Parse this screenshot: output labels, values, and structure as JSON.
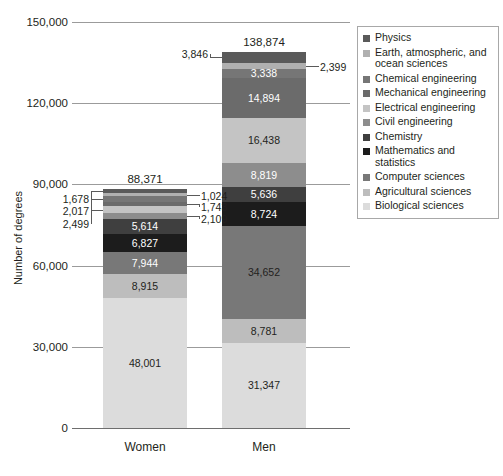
{
  "chart_data": {
    "type": "bar",
    "subtype": "stacked",
    "title": "",
    "xlabel": "",
    "ylabel": "Number of degrees",
    "categories": [
      "Women",
      "Men"
    ],
    "ylim": [
      0,
      150000
    ],
    "yticks": [
      0,
      30000,
      60000,
      90000,
      120000,
      150000
    ],
    "ytick_labels": [
      "0",
      "30,000",
      "60,000",
      "90,000",
      "120,000",
      "150,000"
    ],
    "grid": true,
    "legend_position": "right",
    "totals": {
      "Women": 88371,
      "Men": 138874
    },
    "total_labels": {
      "Women": "88,371",
      "Men": "138,874"
    },
    "series": [
      {
        "name": "Physics",
        "color": "#5a5a5a",
        "values": [
          1678,
          3846
        ],
        "labels": [
          "1,678",
          "3,846"
        ],
        "label_mode": [
          "callout-left",
          "callout-left"
        ]
      },
      {
        "name": "Earth, atmospheric, and ocean sciences",
        "color": "#b0b0b0",
        "values": [
          1024,
          2399
        ],
        "labels": [
          "1,024",
          "2,399"
        ],
        "label_mode": [
          "callout-right",
          "callout-right"
        ]
      },
      {
        "name": "Chemical engineering",
        "color": "#767676",
        "values": [
          2017,
          3338
        ],
        "labels": [
          "2,017",
          "3,338"
        ],
        "label_mode": [
          "callout-left",
          "inside-light"
        ]
      },
      {
        "name": "Mechanical engineering",
        "color": "#6b6b6b",
        "values": [
          1743,
          14894
        ],
        "labels": [
          "1,743",
          "14,894"
        ],
        "label_mode": [
          "callout-right",
          "inside-light"
        ]
      },
      {
        "name": "Electrical engineering",
        "color": "#c4c4c4",
        "values": [
          2499,
          16438
        ],
        "labels": [
          "2,499",
          "16,438"
        ],
        "label_mode": [
          "callout-left",
          "inside-dark"
        ]
      },
      {
        "name": "Civil engineering",
        "color": "#8d8d8d",
        "values": [
          2109,
          8819
        ],
        "labels": [
          "2,109",
          "8,819"
        ],
        "label_mode": [
          "callout-right",
          "inside-light"
        ]
      },
      {
        "name": "Chemistry",
        "color": "#3f3f3f",
        "values": [
          5614,
          5636
        ],
        "labels": [
          "5,614",
          "5,636"
        ],
        "label_mode": [
          "inside-light",
          "inside-light"
        ]
      },
      {
        "name": "Mathematics and statistics",
        "color": "#1c1c1c",
        "values": [
          6827,
          8724
        ],
        "labels": [
          "6,827",
          "8,724"
        ],
        "label_mode": [
          "inside-light",
          "inside-light"
        ]
      },
      {
        "name": "Computer sciences",
        "color": "#787878",
        "values": [
          7944,
          34652
        ],
        "labels": [
          "7,944",
          "34,652"
        ],
        "label_mode": [
          "inside-light",
          "inside-dark"
        ]
      },
      {
        "name": "Agricultural sciences",
        "color": "#bdbdbd",
        "values": [
          8915,
          8781
        ],
        "labels": [
          "8,915",
          "8,781"
        ],
        "label_mode": [
          "inside-dark",
          "inside-dark"
        ]
      },
      {
        "name": "Biological sciences",
        "color": "#dcdcdc",
        "values": [
          48001,
          31347
        ],
        "labels": [
          "48,001",
          "31,347"
        ],
        "label_mode": [
          "inside-dark",
          "inside-dark"
        ]
      }
    ]
  },
  "legend": {
    "items": [
      {
        "label": "Physics",
        "color": "#5a5a5a"
      },
      {
        "label": "Earth, atmospheric, and ocean sciences",
        "color": "#b0b0b0"
      },
      {
        "label": "Chemical engineering",
        "color": "#767676"
      },
      {
        "label": "Mechanical engineering",
        "color": "#6b6b6b"
      },
      {
        "label": "Electrical engineering",
        "color": "#c4c4c4"
      },
      {
        "label": "Civil engineering",
        "color": "#8d8d8d"
      },
      {
        "label": "Chemistry",
        "color": "#3f3f3f"
      },
      {
        "label": "Mathematics and statistics",
        "color": "#1c1c1c"
      },
      {
        "label": "Computer sciences",
        "color": "#787878"
      },
      {
        "label": "Agricultural sciences",
        "color": "#bdbdbd"
      },
      {
        "label": "Biological sciences",
        "color": "#dcdcdc"
      }
    ]
  },
  "axes": {
    "y_title": "Number of degrees"
  }
}
